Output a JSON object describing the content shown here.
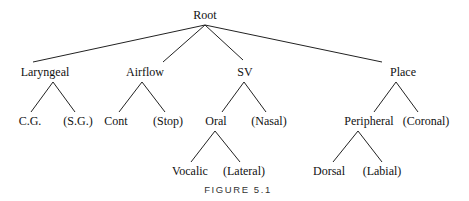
{
  "diagram": {
    "type": "tree",
    "root": "Root",
    "nodes": {
      "root": "Root",
      "laryngeal": "Laryngeal",
      "airflow": "Airflow",
      "sv": "SV",
      "place": "Place",
      "cg": "C.G.",
      "sg": "(S.G.)",
      "cont": "Cont",
      "stop": "(Stop)",
      "oral": "Oral",
      "nasal": "(Nasal)",
      "peripheral": "Peripheral",
      "coronal": "(Coronal)",
      "vocalic": "Vocalic",
      "lateral": "(Lateral)",
      "dorsal": "Dorsal",
      "labial": "(Labial)"
    },
    "edges": [
      [
        "Root",
        "Laryngeal"
      ],
      [
        "Root",
        "Airflow"
      ],
      [
        "Root",
        "SV"
      ],
      [
        "Root",
        "Place"
      ],
      [
        "Laryngeal",
        "C.G."
      ],
      [
        "Laryngeal",
        "(S.G.)"
      ],
      [
        "Airflow",
        "Cont"
      ],
      [
        "Airflow",
        "(Stop)"
      ],
      [
        "SV",
        "Oral"
      ],
      [
        "SV",
        "(Nasal)"
      ],
      [
        "Place",
        "Peripheral"
      ],
      [
        "Place",
        "(Coronal)"
      ],
      [
        "Oral",
        "Vocalic"
      ],
      [
        "Oral",
        "(Lateral)"
      ],
      [
        "Peripheral",
        "Dorsal"
      ],
      [
        "Peripheral",
        "(Labial)"
      ]
    ],
    "caption": "FIGURE 5.1"
  }
}
